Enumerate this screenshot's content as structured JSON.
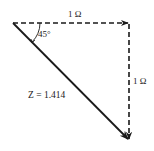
{
  "diagram": {
    "type": "impedance-triangle",
    "colors": {
      "stroke": "#1a1a1a",
      "background": "#ffffff"
    },
    "nodes": [
      {
        "id": "origin",
        "x": 13,
        "y": 23
      },
      {
        "id": "corner",
        "x": 129,
        "y": 23
      },
      {
        "id": "tip",
        "x": 129,
        "y": 140
      }
    ],
    "edges": [
      {
        "id": "resistance",
        "from": "origin",
        "to": "corner",
        "style": "dashed",
        "arrow": true,
        "label": "1 Ω"
      },
      {
        "id": "reactance",
        "from": "corner",
        "to": "tip",
        "style": "dashed",
        "arrow": true,
        "label": "1 Ω"
      },
      {
        "id": "impedance",
        "from": "origin",
        "to": "tip",
        "style": "solid",
        "arrow": true,
        "label": "Z = 1.414"
      }
    ],
    "angle": {
      "at": "origin",
      "label": "45°"
    },
    "labels": {
      "horizontal": "1 Ω",
      "vertical": "1 Ω",
      "hypotenuse": "Z = 1.414",
      "angle": "45°"
    }
  }
}
